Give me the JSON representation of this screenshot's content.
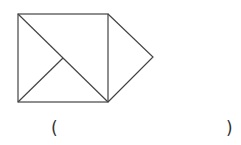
{
  "figure": {
    "stroke_color": "#444444",
    "square": {
      "x": 18,
      "y": 14,
      "width": 90,
      "height": 88
    },
    "diagonal": {
      "x1": 18,
      "y1": 14,
      "x2": 108,
      "y2": 102
    },
    "inner_segment": {
      "x1": 18,
      "y1": 102,
      "x2": 63,
      "y2": 58
    },
    "right_triangle_apex": {
      "x": 153,
      "y": 57
    }
  },
  "answer": {
    "open_paren": "(",
    "close_paren": ")",
    "blank": ""
  }
}
